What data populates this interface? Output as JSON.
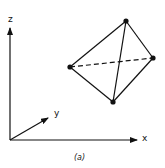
{
  "diagram": {
    "axes": {
      "origin": [
        10,
        140
      ],
      "x": {
        "label": "x",
        "end": [
          137,
          140
        ]
      },
      "y": {
        "label": "y",
        "end": [
          48,
          118
        ]
      },
      "z": {
        "label": "z",
        "end": [
          10,
          28
        ]
      }
    },
    "tetrahedron": {
      "vertices": {
        "top": [
          126,
          21
        ],
        "right": [
          153,
          58
        ],
        "left": [
          70,
          67
        ],
        "bottom": [
          113,
          102
        ]
      },
      "solid_edges": [
        [
          "top",
          "right"
        ],
        [
          "top",
          "left"
        ],
        [
          "top",
          "bottom"
        ],
        [
          "left",
          "bottom"
        ],
        [
          "right",
          "bottom"
        ]
      ],
      "dashed_edges": [
        [
          "left",
          "right"
        ]
      ]
    },
    "caption": "(a)"
  }
}
